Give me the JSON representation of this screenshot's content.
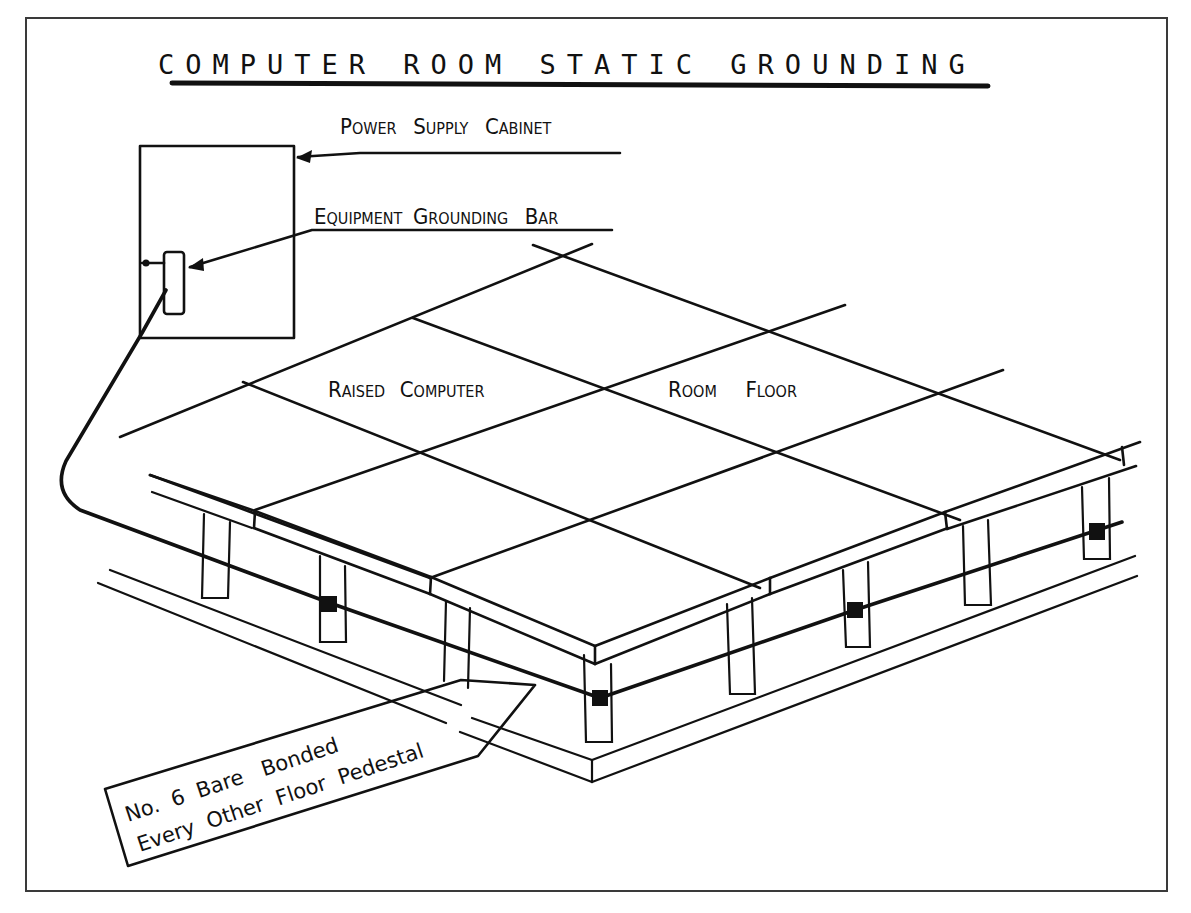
{
  "title": "COMPUTER ROOM STATIC GROUNDING",
  "labels": {
    "power_supply_cabinet": {
      "big1": "P",
      "small1": "OWER",
      "big2": "S",
      "small2": "UPPLY",
      "big3": "C",
      "small3": "ABINET",
      "full": "Power Supply Cabinet"
    },
    "equipment_grounding_bar": {
      "big1": "E",
      "small1": "QUIPMENT",
      "big2": "G",
      "small2": "ROUNDING",
      "big3": "B",
      "small3": "AR",
      "full": "Equipment Grounding Bar"
    },
    "floor_label_left": {
      "big1": "R",
      "small1": "AISED",
      "big2": "C",
      "small2": "OMPUTER",
      "full": "Raised Computer"
    },
    "floor_label_right": {
      "big1": "R",
      "small1": "OOM",
      "big2": "F",
      "small2": "LOOR",
      "full": "Room Floor"
    }
  },
  "callout": {
    "line1": "No.  6  Bare   Bonded",
    "line2": "Every  Other  Floor  Pedestal",
    "full": "No. 6 Bare Bonded Every Other Floor Pedestal"
  },
  "colors": {
    "ink": "#111111",
    "frame": "#3a3a3a",
    "background": "#ffffff"
  }
}
